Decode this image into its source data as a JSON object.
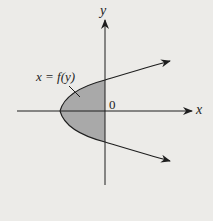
{
  "diagram": {
    "labels": {
      "y_axis": "y",
      "x_axis": "x",
      "origin": "0",
      "curve": "x = f(y)"
    },
    "colors": {
      "background": "#ecebe8",
      "ink": "#1e1e1e",
      "shaded_region": "#a9a9a9"
    }
  }
}
